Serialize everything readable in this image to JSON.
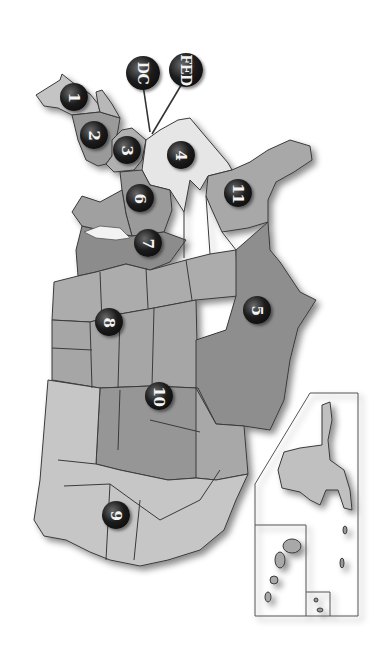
{
  "map": {
    "title": "",
    "orientation": "rotated 90 degrees clockwise",
    "colors": {
      "background": "#ffffff",
      "marker": "#111111",
      "marker_text": "#f4f4f4",
      "border": "#3a3a3a",
      "shade_light": "#c4c4c4",
      "shade_mid": "#a6a6a6",
      "shade_dark": "#8a8a8a",
      "shade_white": "#e6e6e6"
    },
    "markers": [
      {
        "id": "dc",
        "label": "DC",
        "x": 143,
        "y": 73,
        "big": true
      },
      {
        "id": "fed",
        "label": "FED",
        "x": 186,
        "y": 70,
        "big": true
      },
      {
        "id": "c1",
        "label": "1",
        "x": 74,
        "y": 97
      },
      {
        "id": "c2",
        "label": "2",
        "x": 94,
        "y": 135
      },
      {
        "id": "c3",
        "label": "3",
        "x": 127,
        "y": 150
      },
      {
        "id": "c4",
        "label": "4",
        "x": 181,
        "y": 155
      },
      {
        "id": "c11",
        "label": "11",
        "x": 238,
        "y": 193
      },
      {
        "id": "c6",
        "label": "6",
        "x": 140,
        "y": 198
      },
      {
        "id": "c7",
        "label": "7",
        "x": 148,
        "y": 243
      },
      {
        "id": "c8",
        "label": "8",
        "x": 109,
        "y": 322
      },
      {
        "id": "c5",
        "label": "5",
        "x": 257,
        "y": 310
      },
      {
        "id": "c10",
        "label": "10",
        "x": 159,
        "y": 396
      },
      {
        "id": "c9",
        "label": "9",
        "x": 116,
        "y": 515
      }
    ],
    "inset": {
      "label": "Alaska / Hawaii / territories inset"
    }
  }
}
